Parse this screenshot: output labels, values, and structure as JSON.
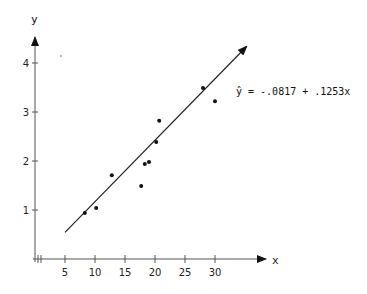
{
  "chart_data": {
    "type": "scatter",
    "title": "",
    "xlabel": "x",
    "ylabel": "y",
    "xlim": [
      0,
      38
    ],
    "ylim": [
      0,
      4.5
    ],
    "x_ticks": [
      "5",
      "10",
      "15",
      "20",
      "25",
      "30"
    ],
    "y_ticks": [
      "1",
      "2",
      "3",
      "4"
    ],
    "grid": false,
    "legend": null,
    "series": [
      {
        "name": "observations",
        "type": "scatter",
        "points": [
          {
            "x": 8.3,
            "y": 0.94
          },
          {
            "x": 10.2,
            "y": 1.04
          },
          {
            "x": 12.8,
            "y": 1.71
          },
          {
            "x": 17.7,
            "y": 1.49
          },
          {
            "x": 18.3,
            "y": 1.94
          },
          {
            "x": 19.0,
            "y": 1.98
          },
          {
            "x": 20.2,
            "y": 2.39
          },
          {
            "x": 20.7,
            "y": 2.82
          },
          {
            "x": 28.0,
            "y": 3.49
          },
          {
            "x": 30.0,
            "y": 3.22
          }
        ]
      },
      {
        "name": "regression line",
        "type": "line",
        "intercept": -0.0817,
        "slope": 0.1253,
        "x_range": [
          5,
          35.3
        ]
      }
    ],
    "annotations": [
      {
        "text": "ŷ = −.0817 + .1253x",
        "x": 33.5,
        "y": 3.4
      }
    ]
  },
  "labels": {
    "x_axis": "x",
    "y_axis": "y",
    "equation": "ŷ = -.0817 + .1253x"
  }
}
